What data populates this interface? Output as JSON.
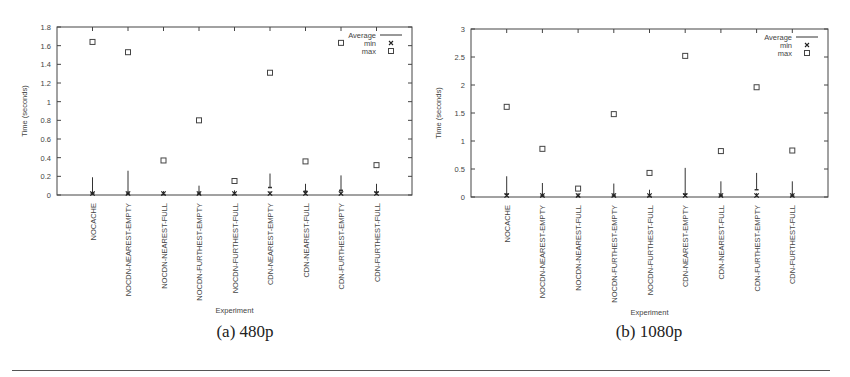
{
  "captions": [
    "(a) 480p",
    "(b) 1080p"
  ],
  "chart_data": [
    {
      "type": "scatter",
      "title": "(a) 480p",
      "xlabel": "Experiment",
      "ylabel": "Time (seconds)",
      "ylim": [
        0,
        1.8
      ],
      "yticks": [
        0,
        0.2,
        0.4,
        0.6,
        0.8,
        1,
        1.2,
        1.4,
        1.6,
        1.8
      ],
      "ytick_labels": [
        "0",
        "0.2",
        "0.4",
        "0.6",
        "0.8",
        "1",
        "1.2",
        "1.4",
        "1.6",
        "1.8"
      ],
      "grid": false,
      "legend_position": "top-right",
      "legend": [
        "Average",
        "min",
        "max"
      ],
      "categories": [
        "NOCACHE",
        "NOCDN-NEAREST-EMPTY",
        "NOCDN-NEAREST-FULL",
        "NOCDN-FURTHEST-EMPTY",
        "NOCDN-FURTHEST-FULL",
        "CDN-NEAREST-EMPTY",
        "CDN-NEAREST-FULL",
        "CDN-FURTHEST-EMPTY",
        "CDN-FURTHEST-FULL"
      ],
      "series": [
        {
          "name": "Average",
          "style": "errorbar",
          "values": [
            0.02,
            0.01,
            0.005,
            0.01,
            0.005,
            0.08,
            0.04,
            0.05,
            0.03
          ],
          "upper": [
            0.19,
            0.26,
            0.02,
            0.1,
            0.05,
            0.23,
            0.12,
            0.21,
            0.12
          ]
        },
        {
          "name": "min",
          "marker": "x",
          "values": [
            0.0,
            0.0,
            0.0,
            0.0,
            0.0,
            0.0,
            0.0,
            0.0,
            0.0
          ]
        },
        {
          "name": "max",
          "marker": "square",
          "values": [
            1.64,
            1.53,
            0.37,
            0.8,
            0.15,
            1.31,
            0.36,
            1.63,
            0.32
          ]
        }
      ]
    },
    {
      "type": "scatter",
      "title": "(b) 1080p",
      "xlabel": "Experiment",
      "ylabel": "Time (seconds)",
      "ylim": [
        0,
        3
      ],
      "yticks": [
        0,
        0.5,
        1,
        1.5,
        2,
        2.5,
        3
      ],
      "ytick_labels": [
        "0",
        "0.5",
        "1",
        "1.5",
        "2",
        "2.5",
        "3"
      ],
      "grid": false,
      "legend_position": "top-right",
      "legend": [
        "Average",
        "min",
        "max"
      ],
      "categories": [
        "NOCACHE",
        "NOCDN-NEAREST-EMPTY",
        "NOCDN-NEAREST-FULL",
        "NOCDN-FURTHEST-EMPTY",
        "NOCDN-FURTHEST-FULL",
        "CDN-NEAREST-EMPTY",
        "CDN-NEAREST-FULL",
        "CDN-FURTHEST-EMPTY",
        "CDN-FURTHEST-FULL"
      ],
      "series": [
        {
          "name": "Average",
          "style": "errorbar",
          "values": [
            0.05,
            0.02,
            0.01,
            0.02,
            0.01,
            0.05,
            0.02,
            0.13,
            0.02
          ],
          "upper": [
            0.37,
            0.25,
            0.03,
            0.24,
            0.13,
            0.52,
            0.28,
            0.43,
            0.28
          ]
        },
        {
          "name": "min",
          "marker": "x",
          "values": [
            0.0,
            0.0,
            0.0,
            0.0,
            0.0,
            0.0,
            0.0,
            0.0,
            0.0
          ]
        },
        {
          "name": "max",
          "marker": "square",
          "values": [
            1.61,
            0.86,
            0.15,
            1.48,
            0.43,
            2.52,
            0.82,
            1.96,
            0.83
          ]
        }
      ]
    }
  ]
}
